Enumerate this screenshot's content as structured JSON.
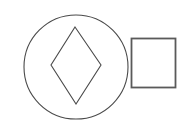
{
  "canvas": {
    "width": 188,
    "height": 135,
    "background_color": "#ffffff",
    "title": "Geometric shapes figure"
  },
  "shapes": [
    {
      "id": "circle",
      "name": "circle",
      "label": "Circle",
      "cx": 76,
      "cy": 67,
      "r": 52,
      "stroke_color": "#4a4a4a",
      "stroke_width": 1.1,
      "fill": "none"
    },
    {
      "id": "diamond",
      "name": "diamond",
      "label": "Diamond",
      "points": "75,27 101,65 76,104 51,65",
      "stroke_color": "#4a4a4a",
      "stroke_width": 1.1,
      "fill": "none"
    },
    {
      "id": "square",
      "name": "square",
      "label": "Square",
      "x": 131.5,
      "y": 38.5,
      "width": 44,
      "height": 49,
      "stroke_color": "#5a5a5a",
      "stroke_width": 1.8,
      "fill": "none"
    }
  ]
}
